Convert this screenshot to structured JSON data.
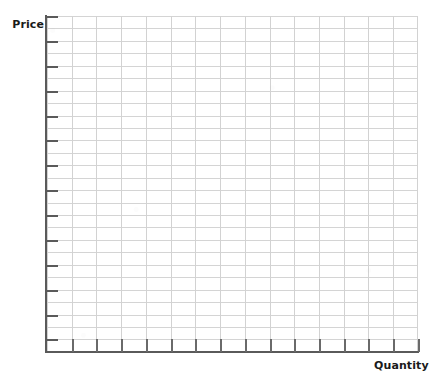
{
  "figure": {
    "kind": "blank-graph-grid",
    "background_color": "#ffffff"
  },
  "axes": {
    "y_title": "Price",
    "x_title": "Quantity",
    "axis_color": "#5a5a5a",
    "gridline_color": "#d3d3d3",
    "label_color": "#1a1a1a"
  },
  "chart_data": {
    "type": "scatter",
    "title": "",
    "subtitle": "",
    "xlabel": "Quantity",
    "ylabel": "Price",
    "x": [],
    "y": [],
    "series": [],
    "annotations": [],
    "legend": [],
    "legend_position": "none",
    "grid": true,
    "xlim": [
      0,
      15
    ],
    "ylim": [
      0,
      27
    ],
    "xticks": [],
    "yticks": [],
    "xticklabels": [],
    "yticklabels": [],
    "note": "Empty grid template: no plotted data, no numeric tick labels. 15 major vertical gridlines and 27 horizontal gridlines; unlabeled tick marks on both axes."
  },
  "grid": {
    "columns": 15,
    "rows": 27,
    "y_tick_count": 14,
    "x_tick_count": 15
  }
}
